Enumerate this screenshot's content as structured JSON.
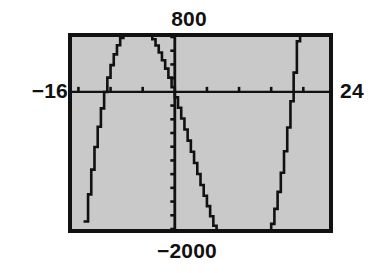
{
  "screen": {
    "kind": "graphing-calculator-screen",
    "background_color": "#c9c9c9",
    "ink_color": "#111111",
    "border_color": "#111111"
  },
  "labels": {
    "top": "800",
    "bottom": "−2000",
    "left": "−16",
    "right": "24"
  },
  "chart_data": {
    "type": "line",
    "title": "",
    "xlabel": "",
    "ylabel": "",
    "xlim": [
      -16,
      24
    ],
    "ylim": [
      -2000,
      800
    ],
    "grid": false,
    "legend": null,
    "axes": {
      "x_axis_y_value": 0,
      "y_axis_x_value": 0,
      "x_tick_step": 5,
      "y_tick_step": 200,
      "x_ticks": [
        -15,
        -10,
        -5,
        0,
        5,
        10,
        15,
        20
      ],
      "y_ticks": [
        -2000,
        -1800,
        -1600,
        -1400,
        -1200,
        -1000,
        -800,
        -600,
        -400,
        -200,
        0,
        200,
        400,
        600,
        800
      ]
    },
    "window_labels": {
      "xmin": "−16",
      "xmax": "24",
      "ymin": "−2000",
      "ymax": "800"
    },
    "series": [
      {
        "name": "cubic",
        "style": "pixelated-stepped",
        "x": [
          -14.0,
          -13.5,
          -13.0,
          -12.5,
          -12.0,
          -11.5,
          -11.0,
          -10.5,
          -10.0,
          -9.5,
          -9.0,
          -8.5,
          -8.0,
          -7.5,
          -7.0,
          -6.5,
          -6.0,
          -5.5,
          -5.0,
          -4.5,
          -4.0,
          -3.5,
          -3.0,
          -2.5,
          -2.0,
          -1.5,
          -1.0,
          -0.5,
          0.0,
          0.5,
          1.0,
          1.5,
          2.0,
          2.5,
          3.0,
          3.5,
          4.0,
          4.5,
          5.0,
          5.5,
          6.0,
          6.5,
          7.0,
          7.5,
          8.0,
          8.5,
          9.0,
          9.5,
          10.0,
          10.5,
          11.0,
          11.5,
          12.0,
          12.5,
          13.0,
          13.5,
          14.0,
          14.5,
          15.0,
          15.5,
          16.0,
          16.5,
          17.0,
          17.5,
          18.0,
          18.5,
          19.0,
          19.5,
          20.0,
          20.5,
          21.0
        ],
        "y": [
          -1890,
          -1495,
          -1134,
          -805,
          -508,
          -241,
          -3,
          207,
          390,
          547,
          679,
          787,
          872,
          935,
          977,
          999,
          1002,
          987,
          955,
          907,
          844,
          767,
          677,
          575,
          462,
          339,
          207,
          67,
          -80,
          -232,
          -389,
          -549,
          -711,
          -874,
          -1037,
          -1199,
          -1359,
          -1515,
          -1667,
          -1813,
          -1952,
          -2083,
          -2205,
          -2316,
          -2416,
          -2503,
          -2576,
          -2634,
          -2676,
          -2700,
          -2705,
          -2690,
          -2654,
          -2595,
          -2513,
          -2406,
          -2273,
          -2113,
          -1925,
          -1707,
          -1459,
          -1179,
          -866,
          -519,
          -137,
          281,
          737,
          1231,
          1764,
          2337,
          2951
        ]
      }
    ],
    "features": {
      "local_maximum": {
        "x": -6.0,
        "y": 1002
      },
      "local_minimum": {
        "x": 11.0,
        "y": -2705
      },
      "x_intercepts": [
        -13.0,
        -0.2,
        18.3
      ]
    }
  }
}
